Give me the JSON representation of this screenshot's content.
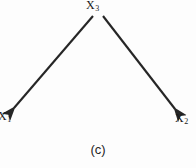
{
  "figure": {
    "caption": "(c)",
    "type": "causal-diagram",
    "background_color": "#fdfdfd",
    "stroke_color": "#262626"
  },
  "nodes": [
    {
      "id": "x3",
      "name": "X3",
      "var": "X",
      "subscript": "3",
      "role": "common-cause",
      "position": {
        "x": 97,
        "y": 8
      }
    },
    {
      "id": "x1",
      "name": "X1",
      "var": "X",
      "subscript": "1",
      "role": "effect",
      "position": {
        "x": 8,
        "y": 116
      }
    },
    {
      "id": "x2",
      "name": "X2",
      "var": "X",
      "subscript": "2",
      "role": "effect",
      "position": {
        "x": 182,
        "y": 118
      }
    }
  ],
  "edges": [
    {
      "id": "edge-x3-x1",
      "from": "X3",
      "to": "X1",
      "arrowhead": "to",
      "x1": 93,
      "y1": 16,
      "x2": 14,
      "y2": 108
    },
    {
      "id": "edge-x3-x2",
      "from": "X3",
      "to": "X2",
      "arrowhead": "to",
      "x1": 103,
      "y1": 16,
      "x2": 175,
      "y2": 109
    }
  ]
}
